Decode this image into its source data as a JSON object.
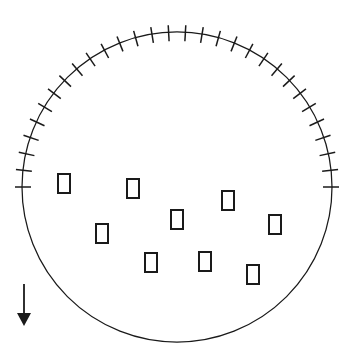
{
  "figure": {
    "background_color": "#ffffff",
    "stroke_color": "#1a1a1a",
    "width": 355,
    "height": 355
  },
  "circle": {
    "name": "boundary-circle",
    "center_x": 177,
    "center_y": 187,
    "radius": 155,
    "stroke_width": 1.25,
    "fill": "none"
  },
  "ticks": {
    "name": "rim-tick-marks",
    "count": 29,
    "start_angle_deg": 180,
    "end_angle_deg": 360,
    "inner_offset": -9,
    "outer_offset": 7,
    "stroke_width": 1.5,
    "description": "radial graduation marks evenly spaced across the lower semicircle"
  },
  "rectangles": {
    "name": "rectangular-markers",
    "count": 9,
    "width": 12,
    "height": 19,
    "stroke_width": 2,
    "fill": "#ffffff",
    "items": [
      {
        "id": "marker-1",
        "x": 58,
        "y": 174
      },
      {
        "id": "marker-2",
        "x": 127,
        "y": 179
      },
      {
        "id": "marker-3",
        "x": 222,
        "y": 191
      },
      {
        "id": "marker-4",
        "x": 171,
        "y": 210
      },
      {
        "id": "marker-5",
        "x": 269,
        "y": 215
      },
      {
        "id": "marker-6",
        "x": 96,
        "y": 224
      },
      {
        "id": "marker-7",
        "x": 145,
        "y": 253
      },
      {
        "id": "marker-8",
        "x": 199,
        "y": 252
      },
      {
        "id": "marker-9",
        "x": 247,
        "y": 265
      }
    ]
  },
  "arrow": {
    "name": "direction-arrow",
    "direction": "down",
    "x": 24,
    "shaft_top_y": 284,
    "shaft_bottom_y": 313,
    "head_tip_y": 326,
    "head_half_width": 7,
    "stroke_width": 1.8
  }
}
